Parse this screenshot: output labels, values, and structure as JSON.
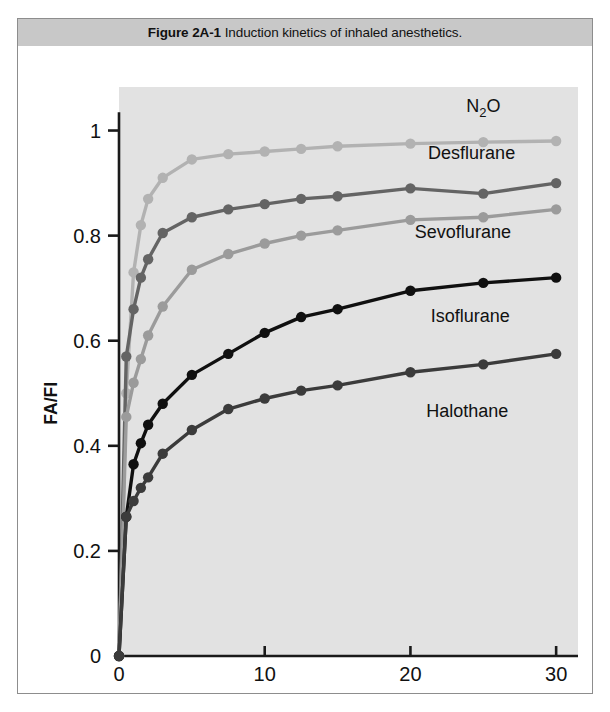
{
  "figure": {
    "caption_label": "Figure 2A-1",
    "caption_text": "Induction kinetics of inhaled anesthetics.",
    "background_color": "#e2e2e2",
    "caption_bar_color": "#c8c8c8"
  },
  "chart_data": {
    "type": "line",
    "title": "Induction kinetics of inhaled anesthetics.",
    "xlabel": "Minutes of Administration",
    "ylabel": "FA/FI",
    "xlim": [
      0,
      31.5
    ],
    "ylim": [
      0,
      1.06
    ],
    "xticks": [
      0,
      10,
      20,
      30
    ],
    "xtick_labels": [
      "0",
      "10",
      "20",
      "30"
    ],
    "yticks": [
      0,
      0.2,
      0.4,
      0.6,
      0.8,
      1
    ],
    "ytick_labels": [
      "0",
      "0.2",
      "0.4",
      "0.6",
      "0.8",
      "1"
    ],
    "grid": false,
    "legend": "inline-labels",
    "x": [
      0,
      0.5,
      1,
      1.5,
      2,
      3,
      5,
      7.5,
      10,
      12.5,
      15,
      20,
      25,
      30
    ],
    "series": [
      {
        "name": "N2O",
        "label": "N₂O",
        "color": "#b2b2b2",
        "values": [
          0,
          0.5,
          0.73,
          0.82,
          0.87,
          0.91,
          0.945,
          0.955,
          0.96,
          0.965,
          0.97,
          0.975,
          0.978,
          0.98
        ],
        "label_x": 25.0,
        "label_y": 1.035
      },
      {
        "name": "Desflurane",
        "label": "Desflurane",
        "color": "#646464",
        "values": [
          0,
          0.57,
          0.66,
          0.72,
          0.755,
          0.805,
          0.835,
          0.85,
          0.86,
          0.87,
          0.875,
          0.89,
          0.88,
          0.9
        ],
        "label_x": 24.2,
        "label_y": 0.945
      },
      {
        "name": "Sevoflurane",
        "label": "Sevoflurane",
        "color": "#9b9b9b",
        "values": [
          0,
          0.455,
          0.52,
          0.565,
          0.61,
          0.665,
          0.735,
          0.765,
          0.785,
          0.8,
          0.81,
          0.83,
          0.835,
          0.85
        ],
        "label_x": 23.6,
        "label_y": 0.795
      },
      {
        "name": "Isoflurane",
        "label": "Isoflurane",
        "color": "#101010",
        "values": [
          0,
          0.265,
          0.365,
          0.405,
          0.44,
          0.48,
          0.535,
          0.575,
          0.615,
          0.645,
          0.66,
          0.695,
          0.71,
          0.72
        ],
        "label_x": 24.1,
        "label_y": 0.635
      },
      {
        "name": "Halothane",
        "label": "Halothane",
        "color": "#3b3b3b",
        "values": [
          0,
          0.265,
          0.295,
          0.32,
          0.34,
          0.385,
          0.43,
          0.47,
          0.49,
          0.505,
          0.515,
          0.54,
          0.555,
          0.575
        ],
        "label_x": 23.9,
        "label_y": 0.455
      }
    ]
  }
}
